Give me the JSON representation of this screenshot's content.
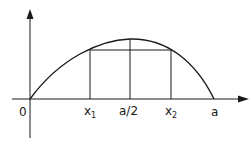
{
  "diagram": {
    "type": "parabola-with-chord",
    "labels": {
      "origin": "0",
      "x1": "x",
      "x1_sub": "1",
      "mid": "a/2",
      "x2": "x",
      "x2_sub": "2",
      "a": "a"
    },
    "colors": {
      "stroke": "#1a1a1a",
      "background": "#ffffff"
    }
  }
}
